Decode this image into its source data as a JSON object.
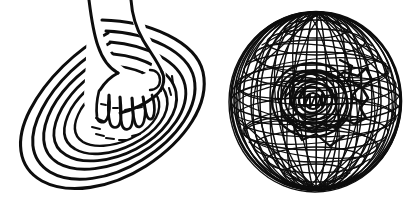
{
  "figure": {
    "title": "Hand in concentric ripples and wireframe sphere",
    "medium": "black ink line drawing on white paper",
    "background_color": "#ffffff",
    "ink_color": "#0d0d0d",
    "canvas": {
      "width": 415,
      "height": 204
    },
    "panels": [
      {
        "id": "left-panel",
        "name": "hand-in-ripples",
        "label": "Hand reaching into concentric oval ripples",
        "bounds": {
          "x": 16,
          "y": 8,
          "width": 192,
          "height": 186
        },
        "elements": [
          {
            "name": "concentric-oval-rings",
            "label": "Concentric oval ripple rings",
            "count": 6
          },
          {
            "name": "hand-with-splayed-fingers",
            "label": "Hand with five splayed fingers reaching down",
            "fingers": 5
          },
          {
            "name": "forearm",
            "label": "Forearm entering from top of frame"
          },
          {
            "name": "hatch-marks",
            "label": "Short dash hatch marks inside inner bowl",
            "count": 14
          }
        ]
      },
      {
        "id": "right-panel",
        "name": "wireframe-sphere",
        "label": "Dense wireframe sphere of crossing lines",
        "bounds": {
          "x": 230,
          "y": 10,
          "width": 172,
          "height": 182
        },
        "center": {
          "cx": 316,
          "cy": 101
        },
        "radius": {
          "rx": 85,
          "ry": 90
        },
        "elements": [
          {
            "name": "sphere-outline",
            "label": "Outer circle of the sphere"
          },
          {
            "name": "meridian-lines",
            "label": "Meridian lines converging at top and bottom poles",
            "count": 26
          },
          {
            "name": "latitude-lines",
            "label": "Latitude ellipse lines across the sphere",
            "count": 20
          },
          {
            "name": "scribble-core",
            "label": "Dense scribbled tangle at the sphere core"
          },
          {
            "name": "north-pole",
            "label": "Top pole point",
            "position": {
              "x": 318,
              "y": 12
            }
          },
          {
            "name": "south-pole",
            "label": "Bottom pole point",
            "position": {
              "x": 316,
              "y": 190
            }
          }
        ]
      }
    ]
  }
}
